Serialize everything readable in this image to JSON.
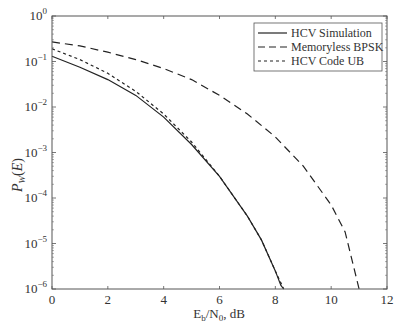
{
  "chart_data": {
    "type": "line",
    "title": "",
    "xlabel": "Eb/N0, dB",
    "ylabel": "P_W(E)",
    "xlim": [
      0,
      12
    ],
    "ylim": [
      1e-06,
      1
    ],
    "yscale": "log",
    "grid": false,
    "legend_position": "upper right",
    "x_ticks": [
      "0",
      "2",
      "4",
      "6",
      "8",
      "10",
      "12"
    ],
    "y_ticks": [
      "10^0",
      "10^-1",
      "10^-2",
      "10^-3",
      "10^-4",
      "10^-5",
      "10^-6"
    ],
    "series": [
      {
        "name": "HCV Simulation",
        "style": "solid",
        "x": [
          0,
          1,
          2,
          3,
          4,
          5,
          6,
          7,
          7.5,
          8,
          8.2,
          8.3
        ],
        "y": [
          0.13,
          0.075,
          0.04,
          0.018,
          0.006,
          0.0015,
          0.0003,
          4e-05,
          1.2e-05,
          2.5e-06,
          1.2e-06,
          1e-06
        ]
      },
      {
        "name": "Memoryless BPSK",
        "style": "dashed",
        "x": [
          0,
          1,
          2,
          3,
          4,
          5,
          6,
          7,
          8,
          9,
          10,
          10.5,
          11
        ],
        "y": [
          0.27,
          0.22,
          0.16,
          0.11,
          0.07,
          0.04,
          0.018,
          0.007,
          0.0022,
          0.0005,
          7e-05,
          1.8e-05,
          1e-06
        ]
      },
      {
        "name": "HCV Code UB",
        "style": "dotted-dash",
        "x": [
          0,
          1,
          2,
          3,
          4,
          5,
          6,
          7,
          7.5,
          8,
          8.3
        ],
        "y": [
          0.19,
          0.11,
          0.055,
          0.022,
          0.007,
          0.0017,
          0.0003,
          4e-05,
          1.2e-05,
          2.5e-06,
          1e-06
        ]
      }
    ]
  },
  "legend": {
    "items": [
      "HCV Simulation",
      "Memoryless BPSK",
      "HCV Code UB"
    ]
  },
  "axes": {
    "xlabel_main": "E",
    "xlabel_sub1": "b",
    "xlabel_mid": "/N",
    "xlabel_sub2": "0",
    "xlabel_tail": ", dB",
    "ylabel_main": "P",
    "ylabel_sub": "W",
    "ylabel_tail": "(E)"
  }
}
